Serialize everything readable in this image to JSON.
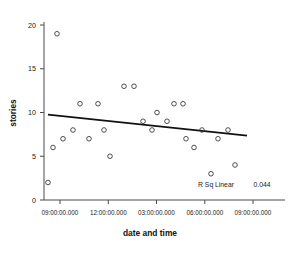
{
  "chart_data": {
    "type": "scatter",
    "title": "",
    "xlabel": "date and time",
    "ylabel": "stories",
    "grid": false,
    "legend": null,
    "ylim": [
      0,
      21
    ],
    "yticks": [
      0,
      5,
      10,
      15,
      20
    ],
    "ytick_labels": [
      "0",
      "5",
      "10",
      "15",
      "20"
    ],
    "xtick_labels": [
      "09:00:00.000",
      "12:00:00.000",
      "03:00:00.000",
      "06:00:00.000",
      "09:00:00.000"
    ],
    "xtick_positions": [
      60,
      108.3,
      156.5,
      204.8,
      253
    ],
    "point_marker": "open-circle",
    "points": [
      {
        "px": 48,
        "y": 2
      },
      {
        "px": 53,
        "y": 6
      },
      {
        "px": 57,
        "y": 19
      },
      {
        "px": 63,
        "y": 7
      },
      {
        "px": 73,
        "y": 8
      },
      {
        "px": 80,
        "y": 11
      },
      {
        "px": 89,
        "y": 7
      },
      {
        "px": 98,
        "y": 11
      },
      {
        "px": 104,
        "y": 8
      },
      {
        "px": 110,
        "y": 5
      },
      {
        "px": 124,
        "y": 13
      },
      {
        "px": 134,
        "y": 13
      },
      {
        "px": 143,
        "y": 9
      },
      {
        "px": 152,
        "y": 8
      },
      {
        "px": 157,
        "y": 10
      },
      {
        "px": 167,
        "y": 9
      },
      {
        "px": 174,
        "y": 11
      },
      {
        "px": 183,
        "y": 11
      },
      {
        "px": 186,
        "y": 7
      },
      {
        "px": 194,
        "y": 6
      },
      {
        "px": 202,
        "y": 8
      },
      {
        "px": 211,
        "y": 3
      },
      {
        "px": 218,
        "y": 7
      },
      {
        "px": 228,
        "y": 8
      },
      {
        "px": 235,
        "y": 4
      }
    ],
    "fit_line": {
      "type": "linear",
      "x_start_px": 48,
      "y_start": 9.75,
      "x_end_px": 247,
      "y_end": 7.35
    },
    "annotation": {
      "label": "R Sq Linear",
      "value": "0.044"
    }
  }
}
